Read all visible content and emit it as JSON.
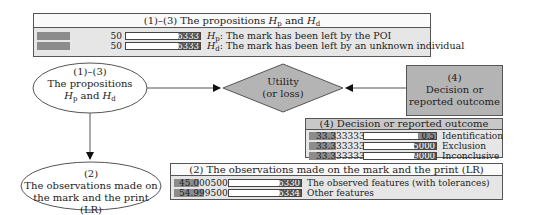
{
  "top_table": {
    "title": "(1)–(3) The propositions Hp and Hd",
    "title_parts": [
      "(1)–(3) The propositions ",
      "H",
      "p",
      " and ",
      "H",
      "d"
    ],
    "rows": [
      {
        "value": "50",
        "prob": "0.996333",
        "label_sym": "H",
        "label_sub": "p",
        "label_text": ": The mark has been left by the POI"
      },
      {
        "value": "50",
        "prob": "0.666333",
        "label_sym": "H",
        "label_sub": "d",
        "label_text": ": The mark has been left by an unknown individual"
      }
    ]
  },
  "nodes": {
    "propositions": {
      "line1": "(1)–(3)",
      "line2": "The propositions",
      "sym1": "H",
      "sub1": "p",
      "and": " and ",
      "sym2": "H",
      "sub2": "d"
    },
    "utility": {
      "line1": "Utility",
      "line2": "(or loss)"
    },
    "decision": {
      "line1": "(4)",
      "line2": "Decision or",
      "line3": "reported outcome"
    },
    "observations": {
      "line1": "(2)",
      "line2": "The observations made on",
      "line3": "the mark and the print (LR)"
    }
  },
  "decision_table": {
    "title": "(4) Decision or reported outcome",
    "rows": [
      {
        "value": "33.333333",
        "prob": "0.5",
        "label": "Identification"
      },
      {
        "value": "33.333333",
        "prob": "0.995000",
        "label": "Exclusion"
      },
      {
        "value": "33.333333",
        "prob": "0.999000",
        "label": "Inconclusive"
      }
    ]
  },
  "observation_table": {
    "title": "(2) The observations made on the mark and the print (LR)",
    "rows": [
      {
        "value": "45.000500",
        "prob": "0.996330",
        "label": "The observed features (with tolerances)"
      },
      {
        "value": "54.999500",
        "prob": "0.696334",
        "label": "Other features"
      }
    ]
  },
  "colors": {
    "node_fill": "#b4b4b4",
    "bar": "#8c8c8c",
    "border": "#555555"
  }
}
